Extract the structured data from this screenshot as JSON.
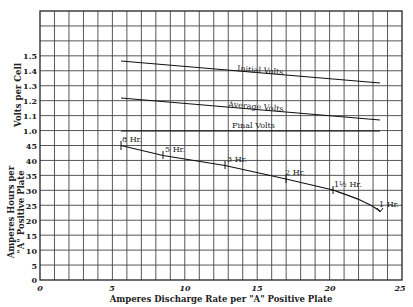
{
  "chart_data": [
    {
      "type": "line",
      "title": "",
      "xlabel": "Amperes Discharge Rate per \"A\" Positive Plate",
      "ylabel": "Volts per Cell",
      "xlim": [
        0,
        25
      ],
      "ylim": [
        1.0,
        1.5
      ],
      "x_ticks": [
        "0",
        "5",
        "10",
        "15",
        "20",
        "25"
      ],
      "y_ticks": [
        "1.0",
        "1.1",
        "1.2",
        "1.3",
        "1.4",
        "1.5"
      ],
      "grid": true,
      "series": [
        {
          "name": "Initial Volts",
          "x": [
            5.6,
            23.5
          ],
          "values": [
            1.47,
            1.32
          ]
        },
        {
          "name": "Average Volts",
          "x": [
            5.6,
            23.5
          ],
          "values": [
            1.22,
            1.07
          ]
        },
        {
          "name": "Final Volts",
          "x": [
            5.6,
            23.5
          ],
          "values": [
            1.0,
            1.0
          ]
        }
      ]
    },
    {
      "type": "line",
      "title": "",
      "xlabel": "Amperes Discharge Rate per \"A\" Positive Plate",
      "ylabel": "Amperes Hours per \"A\" Positive Plate",
      "xlim": [
        0,
        25
      ],
      "ylim": [
        0,
        45
      ],
      "x_ticks": [
        "0",
        "5",
        "10",
        "15",
        "20",
        "25"
      ],
      "y_ticks": [
        "0",
        "5",
        "10",
        "15",
        "20",
        "25",
        "30",
        "35",
        "40",
        "45"
      ],
      "grid": true,
      "series": [
        {
          "name": "Capacity",
          "x": [
            5.6,
            8.5,
            12.8,
            17.0,
            20.2,
            23.5
          ],
          "values": [
            45,
            41.7,
            38.3,
            33.7,
            30,
            23
          ],
          "point_labels": [
            "8 Hr.",
            "5 Hr.",
            "3 Hr.",
            "2 Hr.",
            "1½ Hr.",
            "1 Hr."
          ]
        }
      ]
    }
  ],
  "labels": {
    "y_volts": "Volts per Cell",
    "y_ah_line1": "Amperes Hours per",
    "y_ah_line2": "\"A\" Positive Plate",
    "x_axis": "Amperes Discharge Rate per \"A\" Positive Plate",
    "initial": "Initial Volts",
    "average": "Average Volts",
    "final": "Final Volts",
    "pt8": "8 Hr.",
    "pt5": "5 Hr.",
    "pt3": "3 Hr.",
    "pt2": "2 Hr.",
    "pt15": "1½ Hr.",
    "pt1": "1 Hr."
  },
  "ticks": {
    "volts": [
      "1.5",
      "1.4",
      "1.3",
      "1.2",
      "1.1",
      "1.0"
    ],
    "ah": [
      "45",
      "40",
      "35",
      "30",
      "25",
      "20",
      "15",
      "10",
      "5",
      "0"
    ],
    "x": [
      "0",
      "5",
      "10",
      "15",
      "20",
      "25"
    ]
  }
}
